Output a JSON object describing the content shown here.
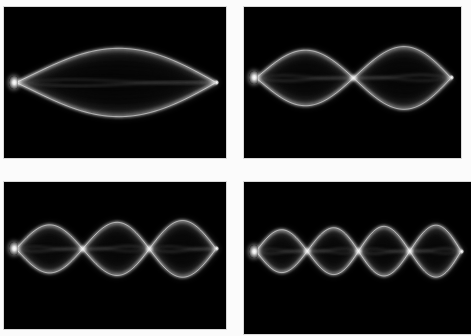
{
  "figure": {
    "background_color": "#ffffff",
    "panel_background_color": "#000000",
    "string_color": "#ffffff",
    "layout": "2x2 grid of photographs",
    "columns": 2,
    "rows": 2
  },
  "panels": [
    {
      "id": "panel-1",
      "position": "top-left",
      "harmonic_number": 1,
      "name": "first-harmonic",
      "antinodes": 1,
      "nodes": 2,
      "node_positions": [
        0,
        1
      ],
      "antinode_positions": [
        0.5
      ],
      "envelope_amplitude": 0.4,
      "driver_label": "mechanical-vibrator",
      "driver_side": "left",
      "fixed_end_side": "right"
    },
    {
      "id": "panel-2",
      "position": "top-right",
      "harmonic_number": 2,
      "name": "second-harmonic",
      "antinodes": 2,
      "nodes": 3,
      "node_positions": [
        0,
        0.5,
        1
      ],
      "antinode_positions": [
        0.25,
        0.75
      ],
      "envelope_amplitude": 0.36,
      "driver_label": "mechanical-vibrator",
      "driver_side": "left",
      "fixed_end_side": "right"
    },
    {
      "id": "panel-3",
      "position": "bottom-left",
      "harmonic_number": 3,
      "name": "third-harmonic",
      "antinodes": 3,
      "nodes": 4,
      "node_positions": [
        0,
        0.3333,
        0.6667,
        1
      ],
      "antinode_positions": [
        0.1667,
        0.5,
        0.8333
      ],
      "envelope_amplitude": 0.33,
      "driver_label": "mechanical-vibrator",
      "driver_side": "left",
      "fixed_end_side": "right"
    },
    {
      "id": "panel-4",
      "position": "bottom-right",
      "harmonic_number": 4,
      "name": "fourth-harmonic",
      "antinodes": 4,
      "nodes": 5,
      "node_positions": [
        0,
        0.25,
        0.5,
        0.75,
        1
      ],
      "antinode_positions": [
        0.125,
        0.375,
        0.625,
        0.875
      ],
      "envelope_amplitude": 0.29,
      "driver_label": "mechanical-vibrator",
      "driver_side": "left",
      "fixed_end_side": "right"
    }
  ],
  "chart_data": {
    "type": "line",
    "xlabel": "position along string (x / L)",
    "ylabel": "transverse displacement (y)",
    "xlim": [
      0,
      1
    ],
    "ylim": [
      -1,
      1
    ],
    "grid": false,
    "legend": "none",
    "series": [
      {
        "name": "n = 1 envelope (+)",
        "harmonic": 1,
        "amplitude": 0.4
      },
      {
        "name": "n = 1 envelope (-)",
        "harmonic": 1,
        "amplitude": -0.4
      },
      {
        "name": "n = 2 envelope (+)",
        "harmonic": 2,
        "amplitude": 0.36
      },
      {
        "name": "n = 2 envelope (-)",
        "harmonic": 2,
        "amplitude": -0.36
      },
      {
        "name": "n = 3 envelope (+)",
        "harmonic": 3,
        "amplitude": 0.33
      },
      {
        "name": "n = 3 envelope (-)",
        "harmonic": 3,
        "amplitude": -0.33
      },
      {
        "name": "n = 4 envelope (+)",
        "harmonic": 4,
        "amplitude": 0.29
      },
      {
        "name": "n = 4 envelope (-)",
        "harmonic": 4,
        "amplitude": -0.29
      }
    ],
    "equation": "y(x) = A sin(n*pi*x/L)"
  }
}
